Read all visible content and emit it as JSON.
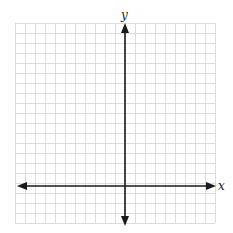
{
  "diagram": {
    "type": "coordinate-plane",
    "x_axis_label": "x",
    "y_axis_label": "y",
    "grid": {
      "left": 15,
      "top": 23,
      "cell_size": 10,
      "columns": 20,
      "rows": 20,
      "line_color": "#d4d4d4"
    },
    "axes": {
      "origin_px": [
        125,
        186
      ],
      "color": "#1a1a1a",
      "arrows": [
        "left",
        "right",
        "up",
        "down"
      ]
    }
  }
}
